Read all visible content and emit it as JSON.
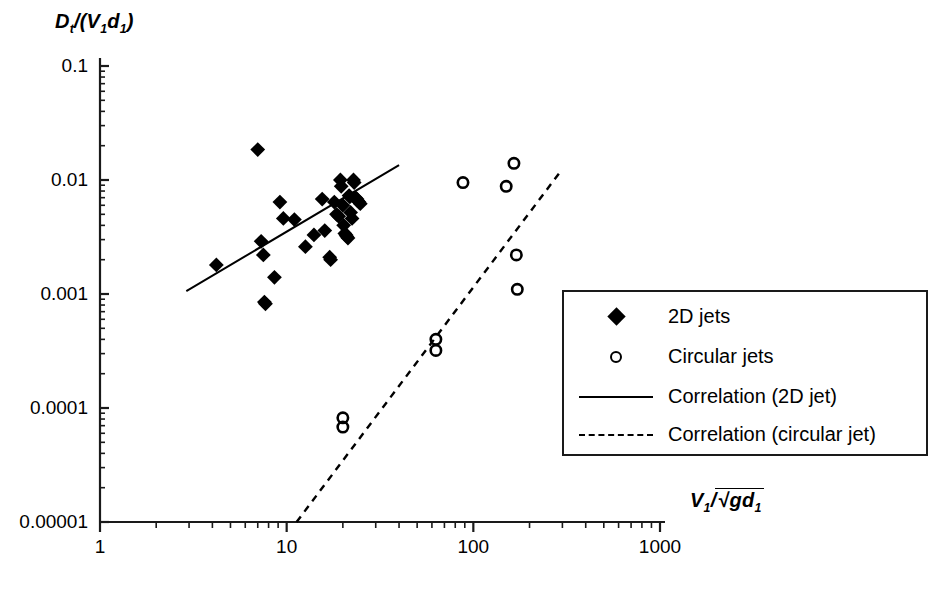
{
  "figure": {
    "background": "#ffffff",
    "ink_color": "#000000"
  },
  "axes": {
    "y": {
      "label_plain": "Dt/(V1d1)",
      "scale": "log",
      "min": 1e-05,
      "max": 0.1,
      "tick_labels": [
        "0.1",
        "0.01",
        "0.001",
        "0.0001",
        "0.00001"
      ],
      "tick_values": [
        0.1,
        0.01,
        0.001,
        0.0001,
        1e-05
      ],
      "minor_ticks": true
    },
    "x": {
      "label_plain": "V1/sqrt(g d1)",
      "scale": "log",
      "min": 1,
      "max": 1000,
      "tick_labels": [
        "1",
        "10",
        "100",
        "1000"
      ],
      "tick_values": [
        1,
        10,
        100,
        1000
      ],
      "minor_ticks": true
    }
  },
  "legend": {
    "position": "bottom-right",
    "items": [
      {
        "label": "2D jets",
        "marker": "filled-diamond"
      },
      {
        "label": "Circular jets",
        "marker": "open-circle"
      },
      {
        "label": "Correlation (2D jet)",
        "marker": "solid-line"
      },
      {
        "label": "Correlation (circular jet)",
        "marker": "dashed-line"
      }
    ]
  },
  "chart_data": {
    "type": "scatter",
    "title": "",
    "xlabel": "V1/sqrt(g d1)",
    "ylabel": "Dt/(V1 d1)",
    "xscale": "log",
    "yscale": "log",
    "xlim": [
      1,
      1000
    ],
    "ylim": [
      1e-05,
      0.1
    ],
    "grid": false,
    "legend_position": "bottom-right",
    "series": [
      {
        "name": "2D jets",
        "marker": "filled-diamond",
        "color": "#000000",
        "points": [
          [
            7.0,
            0.0185
          ],
          [
            4.2,
            0.0018
          ],
          [
            7.3,
            0.0029
          ],
          [
            7.5,
            0.0022
          ],
          [
            7.6,
            0.00085
          ],
          [
            7.7,
            0.00082
          ],
          [
            8.6,
            0.0014
          ],
          [
            9.2,
            0.0064
          ],
          [
            9.6,
            0.0046
          ],
          [
            11.0,
            0.0045
          ],
          [
            12.6,
            0.0026
          ],
          [
            14.0,
            0.0033
          ],
          [
            15.5,
            0.0068
          ],
          [
            16.0,
            0.0036
          ],
          [
            17.0,
            0.0021
          ],
          [
            17.2,
            0.002
          ],
          [
            18.0,
            0.0064
          ],
          [
            18.5,
            0.005
          ],
          [
            19.0,
            0.0048
          ],
          [
            19.4,
            0.01
          ],
          [
            19.6,
            0.0088
          ],
          [
            20.0,
            0.006
          ],
          [
            20.2,
            0.004
          ],
          [
            20.5,
            0.0034
          ],
          [
            20.8,
            0.0033
          ],
          [
            21.0,
            0.0032
          ],
          [
            21.3,
            0.0031
          ],
          [
            21.6,
            0.0073
          ],
          [
            21.8,
            0.0071
          ],
          [
            22.0,
            0.0052
          ],
          [
            22.4,
            0.0046
          ],
          [
            22.8,
            0.01
          ],
          [
            23.0,
            0.0095
          ],
          [
            23.4,
            0.007
          ],
          [
            23.8,
            0.0068
          ],
          [
            24.0,
            0.0066
          ],
          [
            24.4,
            0.0064
          ],
          [
            24.8,
            0.0062
          ]
        ]
      },
      {
        "name": "Circular jets",
        "marker": "open-circle",
        "color": "#000000",
        "points": [
          [
            20.0,
            8.2e-05
          ],
          [
            20.0,
            6.8e-05
          ],
          [
            63.0,
            0.0004
          ],
          [
            63.0,
            0.00032
          ],
          [
            88.0,
            0.0095
          ],
          [
            150.0,
            0.0088
          ],
          [
            165.0,
            0.014
          ],
          [
            170.0,
            0.0022
          ],
          [
            172.0,
            0.0011
          ]
        ]
      }
    ],
    "lines": [
      {
        "name": "Correlation (2D jet)",
        "style": "solid",
        "color": "#000000",
        "start": [
          2.9,
          0.00106
        ],
        "end": [
          40.0,
          0.0135
        ]
      },
      {
        "name": "Correlation (circular jet)",
        "style": "dashed",
        "color": "#000000",
        "start": [
          11.3,
          1e-05
        ],
        "end": [
          300.0,
          0.0125
        ]
      }
    ]
  }
}
